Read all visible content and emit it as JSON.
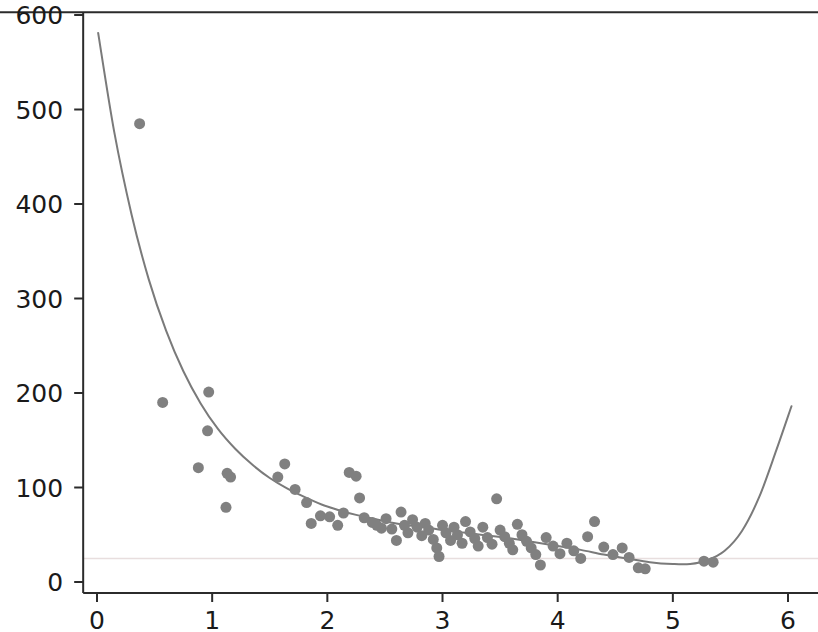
{
  "chart_data": {
    "type": "scatter",
    "title": "",
    "subtitle": "",
    "xlabel": "",
    "ylabel": "",
    "xlim": [
      -0.12,
      6.27
    ],
    "ylim": [
      -11,
      603
    ],
    "xticks": [
      0,
      1,
      2,
      3,
      4,
      5,
      6
    ],
    "xtick_labels": [
      "0",
      "1",
      "2",
      "3",
      "4",
      "5",
      "6"
    ],
    "yticks": [
      0,
      100,
      200,
      300,
      400,
      500,
      600
    ],
    "ytick_labels": [
      "0",
      "100",
      "200",
      "300",
      "400",
      "500",
      "600"
    ],
    "grid": false,
    "legend": null,
    "legend_position": "none",
    "marker_color": "#808080",
    "marker_size": 11,
    "line_color": "#7a7a7a",
    "line_width": 2,
    "axis_color": "#2b2b2b",
    "reference_line_color": "#e8dede",
    "reference_line_y": 25,
    "axes_spines": [
      "left",
      "bottom",
      "top"
    ],
    "series": [
      {
        "name": "observations",
        "type": "scatter",
        "points": [
          [
            0.37,
            485
          ],
          [
            0.57,
            190
          ],
          [
            0.88,
            121
          ],
          [
            0.97,
            201
          ],
          [
            0.96,
            160
          ],
          [
            1.13,
            115
          ],
          [
            1.16,
            111
          ],
          [
            1.12,
            79
          ],
          [
            1.57,
            111
          ],
          [
            1.63,
            125
          ],
          [
            1.72,
            98
          ],
          [
            1.82,
            84
          ],
          [
            1.86,
            62
          ],
          [
            1.94,
            70
          ],
          [
            2.02,
            69
          ],
          [
            2.09,
            60
          ],
          [
            2.14,
            73
          ],
          [
            2.19,
            116
          ],
          [
            2.25,
            112
          ],
          [
            2.28,
            89
          ],
          [
            2.32,
            68
          ],
          [
            2.39,
            63
          ],
          [
            2.43,
            60
          ],
          [
            2.47,
            57
          ],
          [
            2.51,
            67
          ],
          [
            2.56,
            56
          ],
          [
            2.6,
            44
          ],
          [
            2.64,
            74
          ],
          [
            2.67,
            60
          ],
          [
            2.7,
            52
          ],
          [
            2.74,
            66
          ],
          [
            2.78,
            58
          ],
          [
            2.82,
            49
          ],
          [
            2.85,
            62
          ],
          [
            2.88,
            55
          ],
          [
            2.92,
            45
          ],
          [
            2.95,
            36
          ],
          [
            2.97,
            27
          ],
          [
            3.0,
            60
          ],
          [
            3.03,
            52
          ],
          [
            3.07,
            44
          ],
          [
            3.1,
            58
          ],
          [
            3.13,
            50
          ],
          [
            3.17,
            41
          ],
          [
            3.2,
            64
          ],
          [
            3.24,
            53
          ],
          [
            3.28,
            46
          ],
          [
            3.31,
            38
          ],
          [
            3.35,
            58
          ],
          [
            3.39,
            47
          ],
          [
            3.43,
            40
          ],
          [
            3.47,
            88
          ],
          [
            3.5,
            55
          ],
          [
            3.54,
            48
          ],
          [
            3.58,
            41
          ],
          [
            3.61,
            34
          ],
          [
            3.65,
            61
          ],
          [
            3.69,
            50
          ],
          [
            3.73,
            43
          ],
          [
            3.77,
            36
          ],
          [
            3.81,
            29
          ],
          [
            3.85,
            18
          ],
          [
            3.9,
            47
          ],
          [
            3.96,
            38
          ],
          [
            4.02,
            30
          ],
          [
            4.08,
            41
          ],
          [
            4.14,
            33
          ],
          [
            4.2,
            25
          ],
          [
            4.26,
            48
          ],
          [
            4.32,
            64
          ],
          [
            4.4,
            37
          ],
          [
            4.48,
            29
          ],
          [
            4.56,
            36
          ],
          [
            4.62,
            26
          ],
          [
            4.7,
            15
          ],
          [
            4.76,
            14
          ],
          [
            5.27,
            22
          ],
          [
            5.35,
            21
          ]
        ]
      },
      {
        "name": "fitted-curve",
        "type": "line",
        "points": [
          [
            0.01,
            581
          ],
          [
            0.15,
            476
          ],
          [
            0.3,
            389
          ],
          [
            0.45,
            320
          ],
          [
            0.6,
            266
          ],
          [
            0.75,
            223
          ],
          [
            0.9,
            189
          ],
          [
            1.05,
            162
          ],
          [
            1.2,
            141
          ],
          [
            1.35,
            124
          ],
          [
            1.5,
            110
          ],
          [
            1.65,
            99
          ],
          [
            1.8,
            90
          ],
          [
            1.95,
            82
          ],
          [
            2.1,
            76
          ],
          [
            2.25,
            71
          ],
          [
            2.4,
            67
          ],
          [
            2.55,
            63
          ],
          [
            2.7,
            60
          ],
          [
            2.85,
            58
          ],
          [
            3.0,
            55
          ],
          [
            3.2,
            52
          ],
          [
            3.4,
            49
          ],
          [
            3.6,
            46
          ],
          [
            3.8,
            42
          ],
          [
            4.0,
            38
          ],
          [
            4.2,
            34
          ],
          [
            4.4,
            29
          ],
          [
            4.6,
            25
          ],
          [
            4.8,
            21
          ],
          [
            5.0,
            19
          ],
          [
            5.15,
            19
          ],
          [
            5.3,
            23
          ],
          [
            5.45,
            33
          ],
          [
            5.6,
            54
          ],
          [
            5.75,
            90
          ],
          [
            5.9,
            140
          ],
          [
            6.03,
            186
          ]
        ]
      }
    ]
  }
}
